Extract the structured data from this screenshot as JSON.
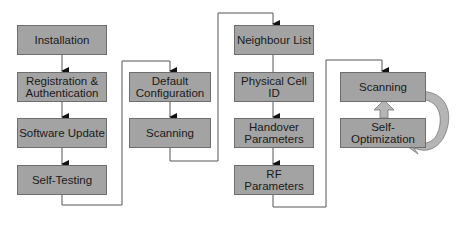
{
  "diagram": {
    "columns": [
      {
        "name": "installation-phase",
        "steps": [
          {
            "id": "installation",
            "label": "Installation"
          },
          {
            "id": "registration-authentication",
            "label": "Registration &\nAuthentication"
          },
          {
            "id": "software-update",
            "label": "Software Update"
          },
          {
            "id": "self-testing",
            "label": "Self-Testing"
          }
        ]
      },
      {
        "name": "configuration-phase",
        "steps": [
          {
            "id": "default-configuration",
            "label": "Default\nConfiguration"
          },
          {
            "id": "scanning-1",
            "label": "Scanning"
          }
        ]
      },
      {
        "name": "parameter-phase",
        "steps": [
          {
            "id": "neighbour-list",
            "label": "Neighbour List"
          },
          {
            "id": "physical-cell-id",
            "label": "Physical Cell ID"
          },
          {
            "id": "handover-parameters",
            "label": "Handover\nParameters"
          },
          {
            "id": "rf-parameters",
            "label": "RF\nParameters"
          }
        ]
      },
      {
        "name": "optimization-loop",
        "steps": [
          {
            "id": "scanning-2",
            "label": "Scanning"
          },
          {
            "id": "self-optimization",
            "label": "Self-Optimization"
          }
        ]
      }
    ],
    "colors": {
      "box_fill": "#a3a3a3",
      "box_border": "#6e6e6e",
      "line": "#555555",
      "loop_arrow": "#b5b5b5"
    }
  }
}
